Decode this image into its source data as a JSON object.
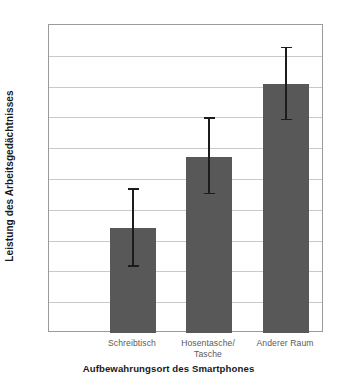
{
  "chart_data": {
    "type": "bar",
    "title": "",
    "xlabel": "Aufbewahrungsort des Smartphones",
    "ylabel": "Leistung des Arbeitsgedächtnisses",
    "categories": [
      "Schreibtisch",
      "Hosentasche/ Tasche",
      "Anderer Raum"
    ],
    "category_lines": [
      [
        "Schreibtisch"
      ],
      [
        "Hosentasche/",
        "Tasche"
      ],
      [
        "Anderer Raum"
      ]
    ],
    "values": [
      28.4,
      30.7,
      33.1
    ],
    "error_low": [
      27.15,
      29.5,
      31.9
    ],
    "error_high": [
      29.7,
      32.0,
      34.3
    ],
    "ylim": [
      25,
      35
    ],
    "ytick_labels": [
      "35",
      "34",
      "33",
      "32",
      "31",
      "30",
      "29",
      "28",
      "27",
      "26",
      "25"
    ],
    "ytick_values": [
      35,
      34,
      33,
      32,
      31,
      30,
      29,
      28,
      27,
      26,
      25
    ],
    "grid": true,
    "legend": "none",
    "bar_color": "#575857",
    "error_color": "#1c1c1c",
    "grid_color": "#c9c9c9",
    "frame_color": "#9a9a9a",
    "background": "#ffffff"
  }
}
